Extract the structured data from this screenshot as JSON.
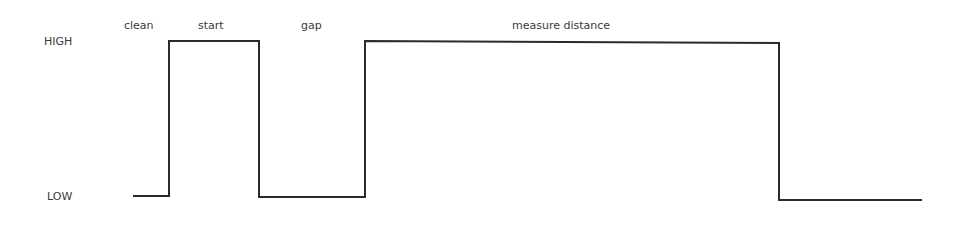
{
  "diagram": {
    "type": "timing-diagram",
    "level_labels": {
      "high": "HIGH",
      "low": "LOW"
    },
    "phase_labels": [
      {
        "text": "clean",
        "x": 124,
        "y": 20
      },
      {
        "text": "start",
        "x": 198,
        "y": 20
      },
      {
        "text": "gap",
        "x": 301,
        "y": 20
      },
      {
        "text": "measure distance",
        "x": 512,
        "y": 20
      }
    ],
    "signal": {
      "color": "#2b2b2b",
      "points": [
        [
          133,
          196
        ],
        [
          169,
          196
        ],
        [
          169,
          41
        ],
        [
          259,
          41
        ],
        [
          259,
          197
        ],
        [
          365,
          197
        ],
        [
          365,
          41
        ],
        [
          779,
          43
        ],
        [
          779,
          200
        ],
        [
          922,
          200
        ]
      ]
    }
  }
}
